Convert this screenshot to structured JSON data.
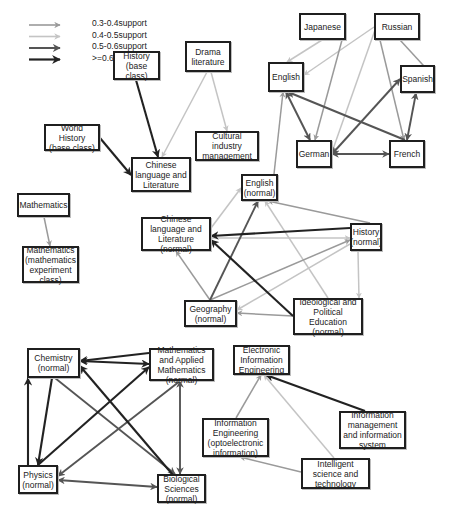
{
  "legend": {
    "items": [
      {
        "label": "0.3-0.4support",
        "color": "#9a9a9a",
        "width": 1.6
      },
      {
        "label": "0.4-0.5support",
        "color": "#c4c4c4",
        "width": 1.6
      },
      {
        "label": "0.5-0.6support",
        "color": "#555555",
        "width": 2.0
      },
      {
        "label": ">=0.6support",
        "color": "#222222",
        "width": 2.2
      }
    ]
  },
  "colors": {
    "c03": "#9a9a9a",
    "c04": "#c4c4c4",
    "c05": "#555555",
    "c06": "#222222",
    "node_border": "#1f1f1f"
  },
  "nodes": [
    {
      "id": "japanese",
      "label": "Japanese",
      "x": 299,
      "y": 13,
      "w": 47,
      "h": 27
    },
    {
      "id": "russian",
      "label": "Russian",
      "x": 374,
      "y": 13,
      "w": 46,
      "h": 27
    },
    {
      "id": "english",
      "label": "English",
      "x": 268,
      "y": 62,
      "w": 36,
      "h": 30
    },
    {
      "id": "spanish",
      "label": "Spanish",
      "x": 400,
      "y": 65,
      "w": 35,
      "h": 28
    },
    {
      "id": "german",
      "label": "German",
      "x": 296,
      "y": 140,
      "w": 36,
      "h": 28
    },
    {
      "id": "french",
      "label": "French",
      "x": 389,
      "y": 140,
      "w": 36,
      "h": 28
    },
    {
      "id": "history_base",
      "label": "History (base class)",
      "x": 113,
      "y": 51,
      "w": 47,
      "h": 29
    },
    {
      "id": "drama",
      "label": "Drama literature",
      "x": 185,
      "y": 41,
      "w": 46,
      "h": 31
    },
    {
      "id": "world_history",
      "label": "World History (base class)",
      "x": 44,
      "y": 124,
      "w": 56,
      "h": 27
    },
    {
      "id": "cultural",
      "label": "Cultural industry management",
      "x": 195,
      "y": 131,
      "w": 64,
      "h": 30
    },
    {
      "id": "chinese",
      "label": "Chinese language and Literature",
      "x": 131,
      "y": 157,
      "w": 60,
      "h": 35
    },
    {
      "id": "mathematics",
      "label": "Mathematics",
      "x": 17,
      "y": 193,
      "w": 53,
      "h": 24
    },
    {
      "id": "math_exp",
      "label": "Mathematics (mathematics experiment class)",
      "x": 22,
      "y": 246,
      "w": 57,
      "h": 37
    },
    {
      "id": "english_n",
      "label": "English (normal)",
      "x": 241,
      "y": 174,
      "w": 37,
      "h": 27
    },
    {
      "id": "chinese_n",
      "label": "Chinese language and Literature (normal)",
      "x": 141,
      "y": 217,
      "w": 70,
      "h": 34
    },
    {
      "id": "history_n",
      "label": "History (normal)",
      "x": 350,
      "y": 223,
      "w": 32,
      "h": 28
    },
    {
      "id": "geography_n",
      "label": "Geography (normal)",
      "x": 184,
      "y": 300,
      "w": 53,
      "h": 27
    },
    {
      "id": "ideological_n",
      "label": "Ideological and Political Education (normal)",
      "x": 293,
      "y": 298,
      "w": 70,
      "h": 37
    },
    {
      "id": "chemistry_n",
      "label": "Chemistry (normal)",
      "x": 27,
      "y": 348,
      "w": 53,
      "h": 30
    },
    {
      "id": "math_applied_n",
      "label": "Mathematics and Applied Mathematics (normal)",
      "x": 149,
      "y": 348,
      "w": 65,
      "h": 33
    },
    {
      "id": "electronic",
      "label": "Electronic Information Engineering",
      "x": 233,
      "y": 345,
      "w": 57,
      "h": 30
    },
    {
      "id": "info_eng",
      "label": "Information Engineering (optoelectronic information)",
      "x": 202,
      "y": 418,
      "w": 67,
      "h": 39
    },
    {
      "id": "info_mgmt",
      "label": "Information management and information system",
      "x": 339,
      "y": 411,
      "w": 67,
      "h": 38
    },
    {
      "id": "intelligent",
      "label": "Intelligent science and technology",
      "x": 301,
      "y": 458,
      "w": 69,
      "h": 31
    },
    {
      "id": "physics_n",
      "label": "Physics (normal)",
      "x": 18,
      "y": 465,
      "w": 40,
      "h": 29
    },
    {
      "id": "biology_n",
      "label": "Biological Sciences (normal)",
      "x": 157,
      "y": 474,
      "w": 49,
      "h": 29
    }
  ],
  "edges": [
    {
      "from": "russian",
      "to": "english",
      "level": "c04",
      "bi": false,
      "x1": 374,
      "y1": 27,
      "x2": 304,
      "y2": 75
    },
    {
      "from": "japanese",
      "to": "english",
      "level": "c04",
      "bi": false,
      "x1": 322,
      "y1": 40,
      "x2": 287,
      "y2": 62
    },
    {
      "from": "japanese",
      "to": "german",
      "level": "c03",
      "bi": false,
      "x1": 342,
      "y1": 40,
      "x2": 315,
      "y2": 140
    },
    {
      "from": "russian",
      "to": "german",
      "level": "c04",
      "bi": false,
      "x1": 375,
      "y1": 30,
      "x2": 332,
      "y2": 152
    },
    {
      "from": "russian",
      "to": "french",
      "level": "c03",
      "bi": false,
      "x1": 380,
      "y1": 40,
      "x2": 404,
      "y2": 140
    },
    {
      "from": "russian",
      "to": "spanish",
      "level": "c03",
      "bi": false,
      "x1": 400,
      "y1": 40,
      "x2": 434,
      "y2": 77
    },
    {
      "from": "german",
      "to": "english",
      "level": "c05",
      "bi": true,
      "x1": 310,
      "y1": 140,
      "x2": 286,
      "y2": 92
    },
    {
      "from": "french",
      "to": "english",
      "level": "c05",
      "bi": false,
      "x1": 405,
      "y1": 140,
      "x2": 288,
      "y2": 92
    },
    {
      "from": "german",
      "to": "spanish",
      "level": "c05",
      "bi": true,
      "x1": 332,
      "y1": 154,
      "x2": 400,
      "y2": 79
    },
    {
      "from": "german",
      "to": "french",
      "level": "c05",
      "bi": true,
      "x1": 332,
      "y1": 154,
      "x2": 389,
      "y2": 154
    },
    {
      "from": "french",
      "to": "spanish",
      "level": "c05",
      "bi": true,
      "x1": 407,
      "y1": 140,
      "x2": 416,
      "y2": 93
    },
    {
      "from": "english_n",
      "to": "english",
      "level": "c03",
      "bi": false,
      "x1": 274,
      "y1": 174,
      "x2": 283,
      "y2": 92
    },
    {
      "from": "history_base",
      "to": "chinese",
      "level": "c06",
      "bi": false,
      "x1": 136,
      "y1": 80,
      "x2": 158,
      "y2": 157
    },
    {
      "from": "world_history",
      "to": "chinese",
      "level": "c06",
      "bi": false,
      "x1": 100,
      "y1": 138,
      "x2": 131,
      "y2": 175
    },
    {
      "from": "drama",
      "to": "chinese",
      "level": "c04",
      "bi": false,
      "x1": 207,
      "y1": 72,
      "x2": 162,
      "y2": 157
    },
    {
      "from": "drama",
      "to": "cultural",
      "level": "c04",
      "bi": false,
      "x1": 211,
      "y1": 72,
      "x2": 227,
      "y2": 131
    },
    {
      "from": "mathematics",
      "to": "math_exp",
      "level": "c03",
      "bi": false,
      "x1": 44,
      "y1": 217,
      "x2": 50,
      "y2": 246
    },
    {
      "from": "history_n",
      "to": "english_n",
      "level": "c03",
      "bi": false,
      "x1": 370,
      "y1": 223,
      "x2": 268,
      "y2": 201
    },
    {
      "from": "history_n",
      "to": "chinese_n",
      "level": "c06",
      "bi": false,
      "x1": 350,
      "y1": 228,
      "x2": 211,
      "y2": 236
    },
    {
      "from": "chinese_n",
      "to": "history_n",
      "level": "c04",
      "bi": false,
      "x1": 211,
      "y1": 238,
      "x2": 350,
      "y2": 238
    },
    {
      "from": "geography_n",
      "to": "english_n",
      "level": "c05",
      "bi": false,
      "x1": 210,
      "y1": 300,
      "x2": 258,
      "y2": 201
    },
    {
      "from": "chinese_n",
      "to": "english_n",
      "level": "c04",
      "bi": false,
      "x1": 211,
      "y1": 228,
      "x2": 241,
      "y2": 188
    },
    {
      "from": "ideological_n",
      "to": "english_n",
      "level": "c04",
      "bi": false,
      "x1": 328,
      "y1": 298,
      "x2": 265,
      "y2": 201
    },
    {
      "from": "geography_n",
      "to": "chinese_n",
      "level": "c03",
      "bi": false,
      "x1": 210,
      "y1": 300,
      "x2": 176,
      "y2": 251
    },
    {
      "from": "geography_n",
      "to": "history_n",
      "level": "c03",
      "bi": false,
      "x1": 210,
      "y1": 300,
      "x2": 350,
      "y2": 240
    },
    {
      "from": "ideological_n",
      "to": "geography_n",
      "level": "c03",
      "bi": false,
      "x1": 293,
      "y1": 316,
      "x2": 237,
      "y2": 313
    },
    {
      "from": "history_n",
      "to": "geography_n",
      "level": "c04",
      "bi": false,
      "x1": 350,
      "y1": 244,
      "x2": 237,
      "y2": 310
    },
    {
      "from": "ideological_n",
      "to": "chinese_n",
      "level": "c06",
      "bi": false,
      "x1": 293,
      "y1": 316,
      "x2": 211,
      "y2": 240
    },
    {
      "from": "history_n",
      "to": "ideological_n",
      "level": "c04",
      "bi": false,
      "x1": 358,
      "y1": 251,
      "x2": 359,
      "y2": 298
    },
    {
      "from": "physics_n",
      "to": "chemistry_n",
      "level": "c06",
      "bi": false,
      "x1": 28,
      "y1": 465,
      "x2": 28,
      "y2": 378
    },
    {
      "from": "chemistry_n",
      "to": "math_applied_n",
      "level": "c06",
      "bi": true,
      "x1": 80,
      "y1": 361,
      "x2": 149,
      "y2": 364
    },
    {
      "from": "math_applied_n",
      "to": "chemistry_n",
      "level": "c06",
      "bi": false,
      "x1": 149,
      "y1": 353,
      "x2": 80,
      "y2": 361
    },
    {
      "from": "chemistry_n",
      "to": "physics_n",
      "level": "c06",
      "bi": false,
      "x1": 52,
      "y1": 378,
      "x2": 38,
      "y2": 465
    },
    {
      "from": "physics_n",
      "to": "math_applied_n",
      "level": "c06",
      "bi": false,
      "x1": 38,
      "y1": 465,
      "x2": 149,
      "y2": 367
    },
    {
      "from": "biology_n",
      "to": "physics_n",
      "level": "c05",
      "bi": true,
      "x1": 58,
      "y1": 480,
      "x2": 157,
      "y2": 487
    },
    {
      "from": "math_applied_n",
      "to": "physics_n",
      "level": "c05",
      "bi": false,
      "x1": 180,
      "y1": 381,
      "x2": 58,
      "y2": 476
    },
    {
      "from": "chemistry_n",
      "to": "biology_n",
      "level": "c05",
      "bi": false,
      "x1": 55,
      "y1": 378,
      "x2": 175,
      "y2": 474
    },
    {
      "from": "biology_n",
      "to": "chemistry_n",
      "level": "c06",
      "bi": false,
      "x1": 190,
      "y1": 495,
      "x2": 80,
      "y2": 366
    },
    {
      "from": "biology_n",
      "to": "math_applied_n",
      "level": "c05",
      "bi": true,
      "x1": 180,
      "y1": 474,
      "x2": 180,
      "y2": 381
    },
    {
      "from": "info_eng",
      "to": "electronic",
      "level": "c03",
      "bi": false,
      "x1": 236,
      "y1": 418,
      "x2": 261,
      "y2": 375
    },
    {
      "from": "intelligent",
      "to": "electronic",
      "level": "c04",
      "bi": false,
      "x1": 334,
      "y1": 458,
      "x2": 264,
      "y2": 375
    },
    {
      "from": "info_mgmt",
      "to": "electronic",
      "level": "c06",
      "bi": false,
      "x1": 365,
      "y1": 411,
      "x2": 266,
      "y2": 375
    },
    {
      "from": "intelligent",
      "to": "info_eng",
      "level": "c03",
      "bi": false,
      "x1": 301,
      "y1": 472,
      "x2": 240,
      "y2": 457
    }
  ]
}
